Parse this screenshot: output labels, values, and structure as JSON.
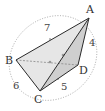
{
  "figure": {
    "vertices": {
      "A": {
        "label": "A",
        "x": 89,
        "y": 18
      },
      "B": {
        "label": "B",
        "x": 16,
        "y": 60
      },
      "C": {
        "label": "C",
        "x": 40,
        "y": 91
      },
      "D": {
        "label": "D",
        "x": 78,
        "y": 65
      }
    },
    "edge_lengths": {
      "AB": "7",
      "AD": "4",
      "BC": "6",
      "CD": "5"
    },
    "colors": {
      "edge": "#2a2a2a",
      "hidden_edge": "#888888",
      "sphere": "#9a9a9a",
      "face_fill": "#d8d8d8"
    }
  }
}
